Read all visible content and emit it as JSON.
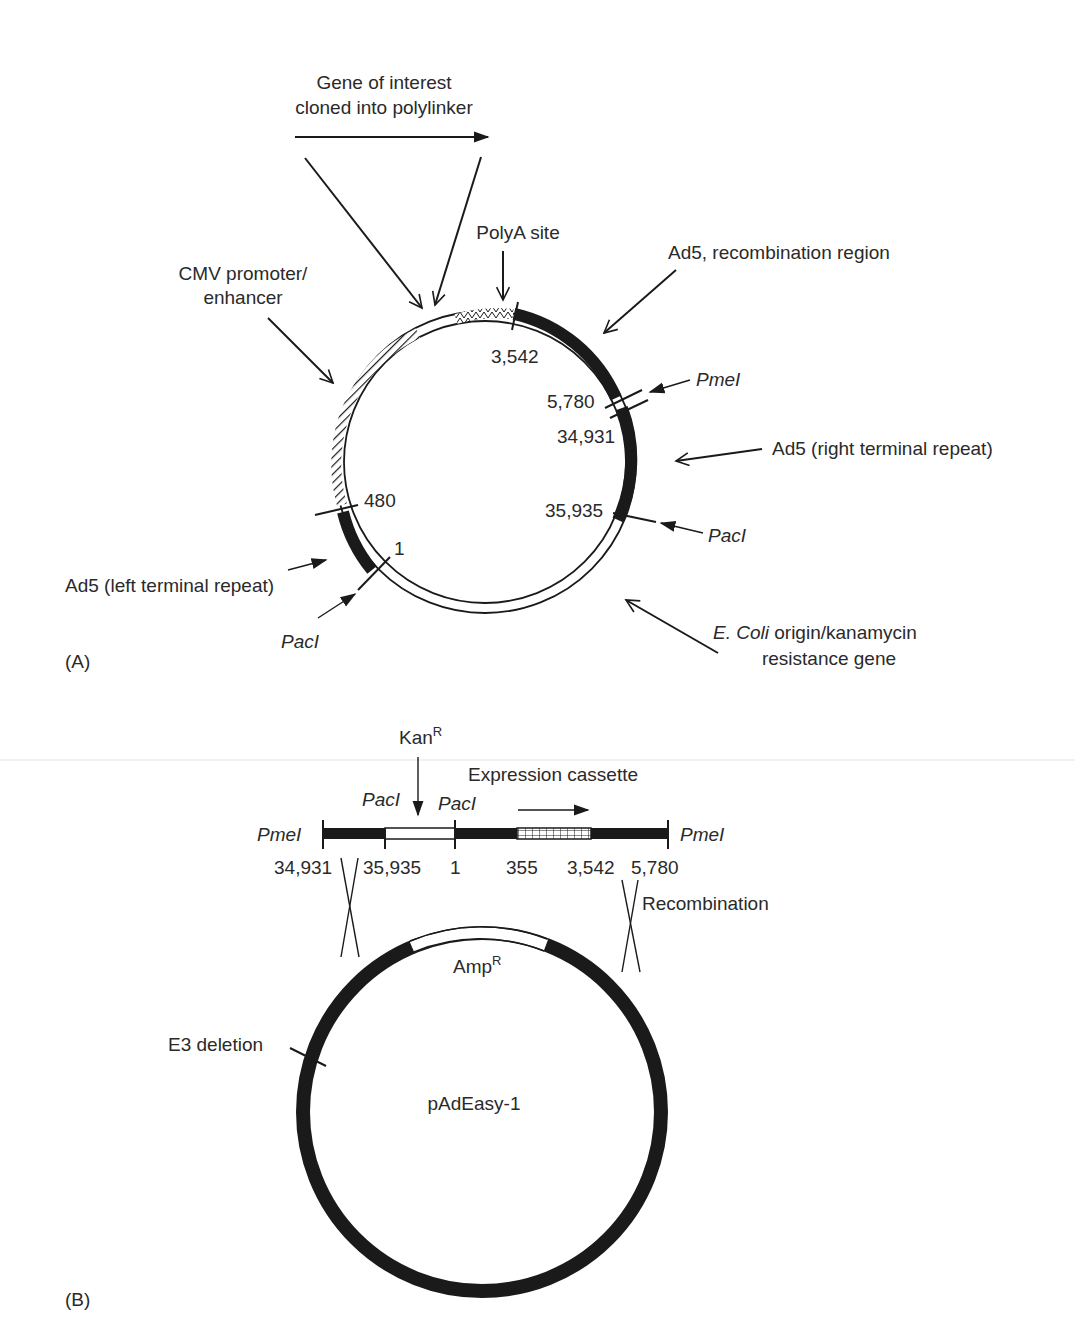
{
  "panel_a": {
    "tag": "(A)",
    "labels": {
      "gene_of_interest_line1": "Gene of interest",
      "gene_of_interest_line2": "cloned into polylinker",
      "polya_site": "PolyA site",
      "cmv_line1": "CMV promoter/",
      "cmv_line2": "enhancer",
      "ad5_recombination": "Ad5, recombination region",
      "pmei": "PmeI",
      "ad5_right": "Ad5 (right terminal repeat)",
      "paci_right": "PacI",
      "ad5_left": "Ad5 (left terminal repeat)",
      "paci_left": "PacI",
      "ecoli_italic": "E. Coli",
      "ecoli_rest": " origin/kanamycin",
      "ecoli_line2": "resistance gene"
    },
    "positions": {
      "p3542": "3,542",
      "p5780": "5,780",
      "p34931": "34,931",
      "p35935": "35,935",
      "p480": "480",
      "p1": "1"
    }
  },
  "panel_b": {
    "tag": "(B)",
    "kanr": "Kan",
    "kanr_sup": "R",
    "expression_cassette": "Expression cassette",
    "paci_1": "PacI",
    "paci_2": "PacI",
    "pmei_left": "PmeI",
    "pmei_right": "PmeI",
    "positions": [
      "34,931",
      "35,935",
      "1",
      "355",
      "3,542",
      "5,780"
    ],
    "recombination": "Recombination",
    "ampr": "Amp",
    "ampr_sup": "R",
    "e3_deletion": "E3 deletion",
    "plasmid_name": "pAdEasy-1"
  },
  "colors": {
    "ink": "#1a1a1a",
    "text": "#2a2a2a",
    "background": "#ffffff"
  }
}
